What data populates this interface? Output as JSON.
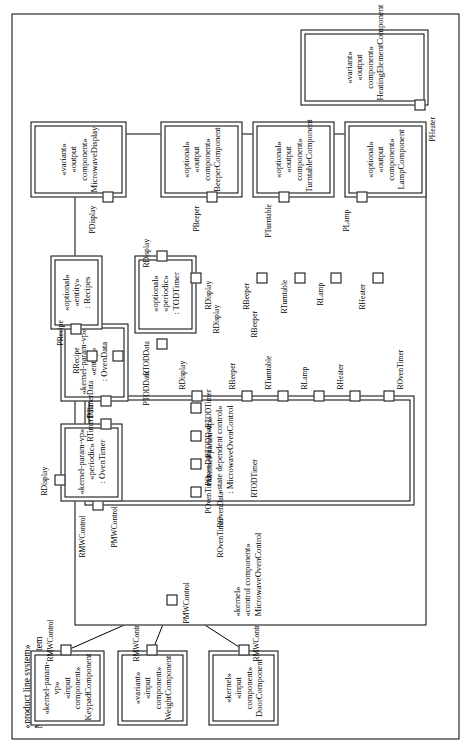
{
  "system": {
    "stereotype": "«product line system»",
    "name": "MicrowaveOvenSystem"
  },
  "components": {
    "keypad": {
      "s1": "«kernel-param-vp»",
      "s2": "«input component»",
      "name": "KeypadComponent"
    },
    "weight": {
      "s1": "«variant»",
      "s2": "«input component»",
      "name": "WeightComponent"
    },
    "door": {
      "s1": "«kernel»",
      "s2": "«input component»",
      "name": "DoorComponent"
    },
    "control": {
      "s1": "«kernel»",
      "s2": "«control component»",
      "name": "MicrowaveOvenControl"
    },
    "sdc": {
      "s1": "«kernel-param-vp»",
      "s2": "«state dependent control»",
      "name": ": MicrowaveOvenControl"
    },
    "oventimer": {
      "s1": "«kernel-param-vp»",
      "s2": "«periodic»",
      "name": ": OvenTimer"
    },
    "ovendata": {
      "s1": "«kernel-param-vp»",
      "s2": "«entity»",
      "name": ": OvenData"
    },
    "recipes": {
      "s1": "«optional»",
      "s2": "«entity»",
      "name": ": Recipes"
    },
    "todtimer": {
      "s1": "«optional»",
      "s2": "«periodic»",
      "name": ": TODTimer"
    },
    "display": {
      "s1": "«variant»",
      "s2": "«output component»",
      "name": "MicrowaveDisplay"
    },
    "beeper": {
      "s1": "«optional»",
      "s2": "«output component»",
      "name": "BeeperComponent"
    },
    "turntable": {
      "s1": "«optional»",
      "s2": "«output component»",
      "name": "TurntableComponent"
    },
    "lamp": {
      "s1": "«optional»",
      "s2": "«output component»",
      "name": "LampComponent"
    },
    "heater": {
      "s1": "«variant»",
      "s2": "«output component»",
      "name": "HeatingElementComponent"
    }
  },
  "ports": {
    "keypad_r": "RMWControl",
    "weight_r": "RMWControl",
    "door_r": "RMWControl",
    "control_p": "PMWControl",
    "control_p2": "PMWControl",
    "sdc_rmw": "RMWControl",
    "sdc_povent": "POvenTimer",
    "sdc_povendata": "POvenData",
    "sdc_ptoddata": "PTODData",
    "oven_rdisplay": "RDisplay",
    "oven_rtimerdata": "RTimerData",
    "oven_ptimerdata": "PTimerData",
    "ovendata_rrecipe": "RRecipe",
    "recipes_precipe": "PRecipe",
    "todtimer_rtoddata": "RTODData",
    "todtimer_rdisplay": "RDisplay",
    "todtimer_ptodtimer": "PTODTimer",
    "bus_roventimer": "ROvenTimer",
    "bus_rovendata": "ROvenData",
    "bus_rtodtimer": "RTODTimer",
    "bus_rtoddata": "RTODData",
    "bus_rdisplay": "RDisplay",
    "bus_rbeeper": "RBeeper",
    "bus_rturntable": "RTurntable",
    "bus_rlamp": "RLamp",
    "bus_rheater": "RHeater",
    "sdc_roventimer": "ROvenTimer",
    "sdc_rovendata": "ROvenData",
    "sdc_rtodtimer": "RTODTimer",
    "sdc_rdisplay": "RDisplay",
    "sdc_rbeeper": "RBeeper",
    "sdc_rturntable": "RTurntable",
    "sdc_rlamp": "RLamp",
    "sdc_rheater": "RHeater",
    "out_rdisplay": "RDisplay",
    "out_rbeeper": "RBeeper",
    "out_rturntable": "RTurntable",
    "out_rlamp": "RLamp",
    "out_rheater": "RHeater",
    "display_p": "PDisplay",
    "beeper_p": "PBeeper",
    "turntable_p": "PTurntable",
    "lamp_p": "PLamp",
    "heater_p": "PHeater",
    "mid_ptodtimer": "PTODTimer",
    "mid_rtoddata": "RTODData",
    "mid_ptoddata": "PTODData",
    "mid_rdisplay": "RDisplay",
    "mid_rbeeper": "RBeeper"
  }
}
